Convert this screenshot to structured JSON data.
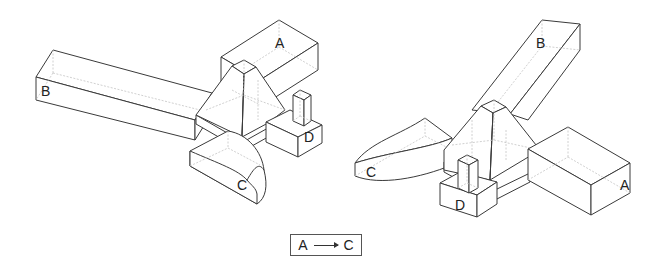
{
  "figures": [
    {
      "id": "left-view",
      "labels": {
        "a": "A",
        "b": "B",
        "c": "C",
        "d": "D"
      }
    },
    {
      "id": "right-view",
      "labels": {
        "a": "A",
        "b": "B",
        "c": "C",
        "d": "D"
      }
    }
  ],
  "legend": {
    "from": "A",
    "to": "C",
    "arrow": "right-arrow"
  },
  "colors": {
    "line": "#3a3a3a",
    "hidden_line": "#c4c4c4",
    "background": "#ffffff"
  }
}
